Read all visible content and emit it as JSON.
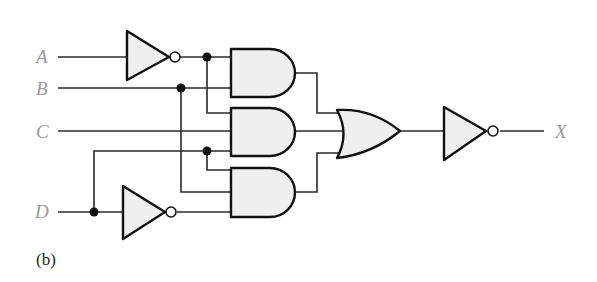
{
  "diagram": {
    "type": "logic-circuit",
    "caption": "(b)",
    "inputs": [
      {
        "id": "A",
        "label": "A"
      },
      {
        "id": "B",
        "label": "B"
      },
      {
        "id": "C",
        "label": "C"
      },
      {
        "id": "D",
        "label": "D"
      }
    ],
    "output": {
      "id": "X",
      "label": "X"
    },
    "gates": [
      {
        "id": "not_a",
        "type": "NOT",
        "inputs": [
          "A"
        ]
      },
      {
        "id": "not_d",
        "type": "NOT",
        "inputs": [
          "D"
        ]
      },
      {
        "id": "and1",
        "type": "AND",
        "inputs": [
          "not_a",
          "B"
        ]
      },
      {
        "id": "and2",
        "type": "AND",
        "inputs": [
          "not_a",
          "C",
          "D"
        ]
      },
      {
        "id": "and3",
        "type": "AND",
        "inputs": [
          "D",
          "B",
          "not_d"
        ]
      },
      {
        "id": "or1",
        "type": "OR",
        "inputs": [
          "and1",
          "and2",
          "and3"
        ]
      },
      {
        "id": "not_out",
        "type": "NOT",
        "inputs": [
          "or1"
        ],
        "output": "X"
      }
    ],
    "colors": {
      "wire": "#2a2a2a",
      "gate_fill": "#efefef",
      "label": "#9a9a9a"
    }
  }
}
